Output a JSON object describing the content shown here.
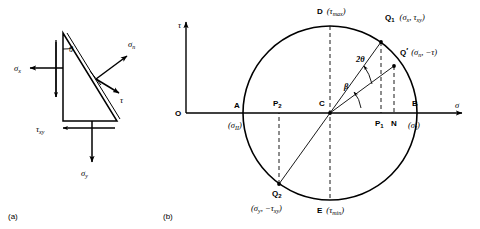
{
  "figure": {
    "panel_a": {
      "caption": "(a)",
      "labels": {
        "theta": "θ",
        "sigma_x": "σ",
        "sigma_x_sub": "x",
        "sigma_y": "σ",
        "sigma_y_sub": "y",
        "sigma_n": "σ",
        "sigma_n_sub": "n",
        "tau": "τ",
        "tau_xy": "τ",
        "tau_xy_sub": "xy"
      }
    },
    "panel_b": {
      "caption": "(b)",
      "axes": {
        "vertical_label": "τ",
        "horizontal_label": "σ",
        "origin_label": "O"
      },
      "points": {
        "A": {
          "name": "A",
          "value": "(σ",
          "value_sub": "II",
          "value_close": ")"
        },
        "B": {
          "name": "B",
          "value": "(σ",
          "value_sub": "I",
          "value_close": ")"
        },
        "C": {
          "name": "C"
        },
        "D": {
          "name": "D",
          "value": "(τ",
          "value_sub": "max",
          "value_close": ")"
        },
        "E": {
          "name": "E",
          "value": "(τ",
          "value_sub": "min",
          "value_close": ")"
        },
        "N": {
          "name": "N"
        },
        "P1": {
          "name": "P",
          "name_sub": "1"
        },
        "P2": {
          "name": "P",
          "name_sub": "2"
        },
        "Q1": {
          "name": "Q",
          "name_sub": "1",
          "value": "(σ",
          "value_sub": "x",
          "value_mid": ", τ",
          "value_sub2": "xy",
          "value_close": ")"
        },
        "Q2": {
          "name": "Q",
          "name_sub": "2",
          "value": "(σ",
          "value_sub": "y",
          "value_mid": ", −τ",
          "value_sub2": "xy",
          "value_close": ")"
        },
        "Qprime": {
          "name": "Q",
          "name_prime": "′",
          "value": "(σ",
          "value_sub": "n",
          "value_mid": ", −τ",
          "value_close": ")"
        }
      },
      "angles": {
        "two_theta": "2θ",
        "beta": "β"
      }
    },
    "colors": {
      "stroke": "#000000",
      "background": "#ffffff"
    }
  }
}
